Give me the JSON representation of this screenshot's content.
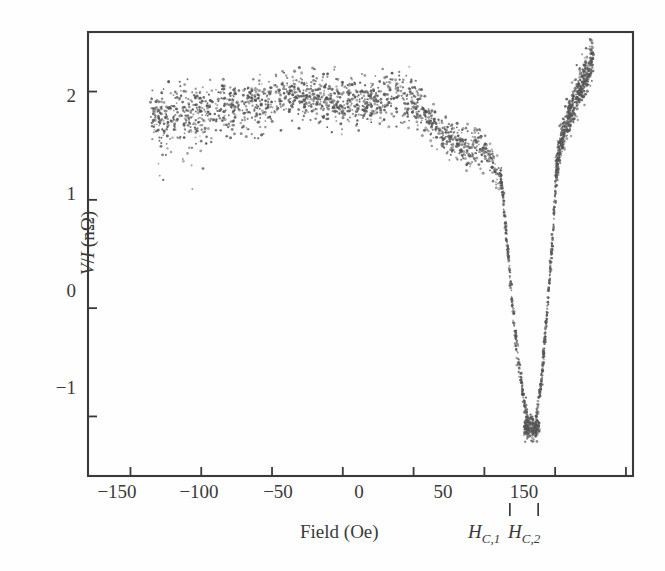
{
  "figure": {
    "kind": "scientific-scatter-plot",
    "background_color": "#fefefe",
    "ink_color": "#3a3a3a",
    "point_color": "#555555"
  },
  "axes": {
    "x_title": "Field (Oe)",
    "y_title_prefix": "V",
    "y_title_slash": "/",
    "y_title_current": "I",
    "y_title_unit": " (nΩ)",
    "x_tick_labels": [
      "−150",
      "−100",
      "−50",
      "0",
      "50",
      "150"
    ],
    "y_tick_labels": [
      "2",
      "1",
      "0",
      "−1"
    ]
  },
  "annotations": {
    "hc1_letter": "H",
    "hc1_sub": "C,1",
    "hc2_letter": "H",
    "hc2_sub": "C,2"
  },
  "chart_data": {
    "type": "scatter",
    "title": "",
    "subtitle": "",
    "xlabel": "Field (Oe)",
    "ylabel": "V/I (nΩ)",
    "xlim": [
      -180,
      205
    ],
    "ylim": [
      -1.55,
      2.55
    ],
    "grid": false,
    "legend": "none",
    "x_ticks": [
      -150,
      -100,
      -50,
      0,
      50,
      100,
      150,
      200
    ],
    "x_ticks_labeled": [
      -150,
      -100,
      -50,
      0,
      50,
      150
    ],
    "y_ticks": [
      2,
      1,
      0,
      -1
    ],
    "annotations": [
      {
        "name": "H_C,1",
        "label": "H_{C,1}",
        "x": 118,
        "kind": "field-marker-tick"
      },
      {
        "name": "H_C,2",
        "label": "H_{C,2}",
        "x": 138,
        "kind": "field-marker-tick"
      }
    ],
    "series": [
      {
        "name": "V/I measurement",
        "marker": "small-dot",
        "color": "#555555",
        "segments": [
          {
            "name": "plateau",
            "x_range": [
              -135,
              62
            ],
            "y_mean": 1.82,
            "y_scatter": 0.22,
            "n_points": 1150
          },
          {
            "name": "plateau-edge-fall",
            "x_range": [
              62,
              112
            ],
            "y_from": 1.75,
            "y_to": 1.25,
            "y_scatter": 0.18,
            "n_points": 180
          },
          {
            "name": "descending-branch",
            "x_range": [
              112,
              128
            ],
            "y_from": 1.25,
            "y_to": -1.05,
            "y_scatter": 0.06,
            "n_points": 150
          },
          {
            "name": "dip-bottom",
            "x_range": [
              126,
              138
            ],
            "y_mean": -1.1,
            "y_scatter": 0.09,
            "n_points": 120
          },
          {
            "name": "ascending-branch",
            "x_range": [
              136,
              152
            ],
            "y_from": -1.05,
            "y_to": 1.4,
            "y_scatter": 0.06,
            "n_points": 150
          },
          {
            "name": "recovery-rise",
            "x_range": [
              150,
              176
            ],
            "y_from": 1.45,
            "y_to": 2.3,
            "y_scatter": 0.17,
            "n_points": 330
          }
        ],
        "key_points": [
          {
            "x": -135,
            "y": 1.78
          },
          {
            "x": -120,
            "y": 1.8
          },
          {
            "x": -100,
            "y": 1.83
          },
          {
            "x": -80,
            "y": 1.85
          },
          {
            "x": -60,
            "y": 1.88
          },
          {
            "x": -40,
            "y": 1.95
          },
          {
            "x": -20,
            "y": 1.95
          },
          {
            "x": 0,
            "y": 1.9
          },
          {
            "x": 20,
            "y": 1.92
          },
          {
            "x": 40,
            "y": 1.95
          },
          {
            "x": 55,
            "y": 1.85
          },
          {
            "x": 70,
            "y": 1.6
          },
          {
            "x": 85,
            "y": 1.5
          },
          {
            "x": 100,
            "y": 1.45
          },
          {
            "x": 112,
            "y": 1.2
          },
          {
            "x": 116,
            "y": 0.6
          },
          {
            "x": 120,
            "y": 0.0
          },
          {
            "x": 124,
            "y": -0.5
          },
          {
            "x": 128,
            "y": -0.85
          },
          {
            "x": 132,
            "y": -1.12
          },
          {
            "x": 136,
            "y": -1.1
          },
          {
            "x": 140,
            "y": -0.7
          },
          {
            "x": 144,
            "y": -0.1
          },
          {
            "x": 148,
            "y": 0.6
          },
          {
            "x": 151,
            "y": 1.3
          },
          {
            "x": 155,
            "y": 1.6
          },
          {
            "x": 162,
            "y": 1.85
          },
          {
            "x": 170,
            "y": 2.1
          },
          {
            "x": 176,
            "y": 2.3
          }
        ]
      }
    ]
  }
}
